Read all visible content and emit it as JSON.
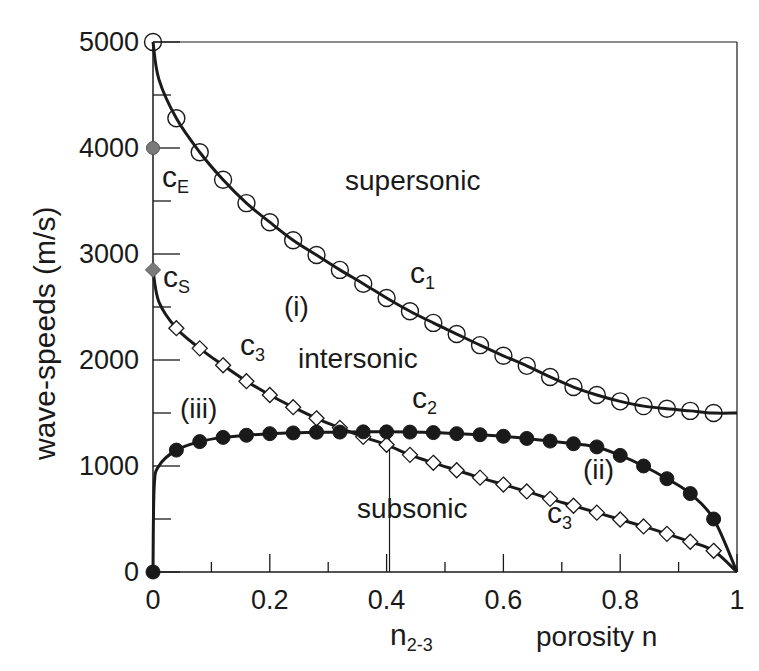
{
  "chart_data": {
    "type": "line",
    "title": "",
    "xlabel": "porosity  n",
    "ylabel": "wave-speeds (m/s)",
    "xlim": [
      0,
      1
    ],
    "ylim": [
      0,
      5000
    ],
    "x_ticks": [
      "0",
      "0.2",
      "0.4",
      "0.6",
      "0.8",
      "1"
    ],
    "y_ticks": [
      "0",
      "1000",
      "2000",
      "3000",
      "4000",
      "5000"
    ],
    "grid": false,
    "legend": "none (curves labelled inline)",
    "x": [
      0,
      0.04,
      0.08,
      0.12,
      0.16,
      0.2,
      0.24,
      0.28,
      0.32,
      0.36,
      0.4,
      0.44,
      0.48,
      0.52,
      0.56,
      0.6,
      0.64,
      0.68,
      0.72,
      0.76,
      0.8,
      0.84,
      0.88,
      0.92,
      0.96,
      1.0
    ],
    "series": [
      {
        "name": "c1",
        "marker": "open-circle",
        "values": [
          5000,
          4280,
          3960,
          3700,
          3480,
          3300,
          3130,
          2990,
          2850,
          2720,
          2585,
          2460,
          2350,
          2245,
          2140,
          2040,
          1945,
          1840,
          1745,
          1670,
          1610,
          1565,
          1540,
          1520,
          1500,
          1500
        ]
      },
      {
        "name": "c3",
        "marker": "open-diamond",
        "values": [
          2850,
          2300,
          2110,
          1950,
          1800,
          1670,
          1555,
          1450,
          1360,
          1275,
          1200,
          1105,
          1030,
          960,
          890,
          825,
          760,
          690,
          625,
          560,
          495,
          430,
          360,
          285,
          200,
          0
        ]
      },
      {
        "name": "c2",
        "marker": "filled-circle",
        "values": [
          0,
          1150,
          1230,
          1270,
          1290,
          1305,
          1312,
          1318,
          1320,
          1322,
          1322,
          1320,
          1315,
          1305,
          1295,
          1280,
          1260,
          1235,
          1210,
          1180,
          1100,
          1000,
          880,
          740,
          500,
          0
        ]
      }
    ],
    "special_points": [
      {
        "label": "cE",
        "x": 0,
        "y": 4000,
        "marker": "grey-filled-circle"
      },
      {
        "label": "cS",
        "x": 0,
        "y": 2850,
        "marker": "grey-filled-diamond"
      }
    ],
    "annotations": [
      {
        "text": "supersonic",
        "x": 0.33,
        "y": 3700
      },
      {
        "text": "intersonic",
        "x": 0.33,
        "y": 2100
      },
      {
        "text": "subsonic",
        "x": 0.35,
        "y": 600
      },
      {
        "text": "(i)",
        "x": 0.25,
        "y": 2500
      },
      {
        "text": "(ii)",
        "x": 0.77,
        "y": 950
      },
      {
        "text": "(iii)",
        "x": 0.08,
        "y": 1600
      },
      {
        "text": "c1",
        "x": 0.44,
        "y": 2750
      },
      {
        "text": "c2",
        "x": 0.44,
        "y": 1620
      },
      {
        "text": "c3",
        "x": 0.15,
        "y": 2100
      },
      {
        "text": "c3",
        "x": 0.68,
        "y": 450
      },
      {
        "text": "n2-3",
        "x": 0.405,
        "y": -600,
        "note": "vertical marker line at crossing of c2 and c3"
      }
    ],
    "crossing_n23": 0.405
  },
  "labels": {
    "ylabel": "wave-speeds (m/s)",
    "xlabel": "porosity  n",
    "n23_main": "n",
    "n23_sub": "2-3",
    "supersonic": "supersonic",
    "intersonic": "intersonic",
    "subsonic": "subsonic",
    "region_i": "(i)",
    "region_ii": "(ii)",
    "region_iii": "(iii)",
    "c_main": "c",
    "sub_1": "1",
    "sub_2": "2",
    "sub_3": "3",
    "sub_E": "E",
    "sub_S": "S"
  },
  "colors": {
    "line": "#1a1a1a",
    "marker_special": "#7a7a7a",
    "background": "#ffffff"
  }
}
